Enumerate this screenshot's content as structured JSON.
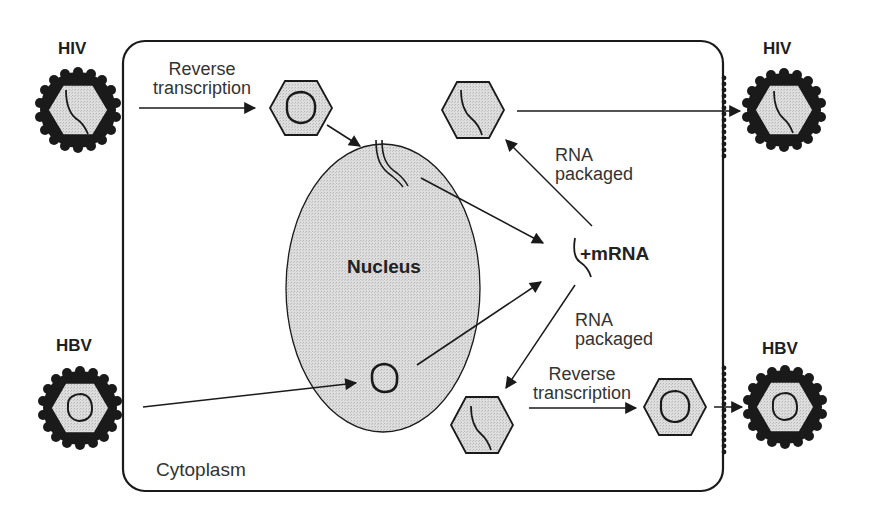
{
  "diagram": {
    "type": "viral life cycle comparison",
    "compartments": {
      "cell_label": "Cytoplasm",
      "nucleus_label": "Nucleus"
    },
    "viruses": {
      "hiv_in": {
        "label": "HIV",
        "genome": "RNA"
      },
      "hiv_out": {
        "label": "HIV",
        "genome": "RNA"
      },
      "hbv_in": {
        "label": "HBV",
        "genome": "DNA"
      },
      "hbv_out": {
        "label": "HBV",
        "genome": "DNA"
      }
    },
    "steps": {
      "hiv_reverse_transcription": "Reverse transcription",
      "hiv_rna_packaged": "RNA packaged",
      "mrna": "+mRNA",
      "hbv_rna_packaged": "RNA packaged",
      "hbv_reverse_transcription": "Reverse transcription"
    },
    "step_lines": {
      "rt_top_1": "Reverse",
      "rt_top_2": "transcription",
      "pk_top_1": "RNA",
      "pk_top_2": "packaged",
      "pk_bot_1": "RNA",
      "pk_bot_2": "packaged",
      "rt_bot_1": "Reverse",
      "rt_bot_2": "transcription"
    },
    "colors": {
      "stroke": "#1a1a1a",
      "fill_gray": "#d9d9d9",
      "background": "#ffffff"
    }
  }
}
